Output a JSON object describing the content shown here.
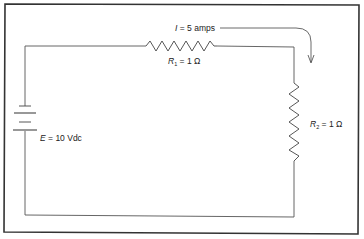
{
  "diagram": {
    "type": "series-circuit",
    "source": {
      "symbol": "E",
      "equals": "=",
      "value": "10 Vdc"
    },
    "current": {
      "symbol": "I",
      "equals": "=",
      "value": "5 amps"
    },
    "resistors": [
      {
        "symbol": "R",
        "subscript": "1",
        "equals": "=",
        "value": "1 Ω"
      },
      {
        "symbol": "R",
        "subscript": "2",
        "equals": "=",
        "value": "1 Ω"
      }
    ],
    "colors": {
      "wire": "#555555",
      "frame": "#333333",
      "text": "#222222"
    }
  }
}
